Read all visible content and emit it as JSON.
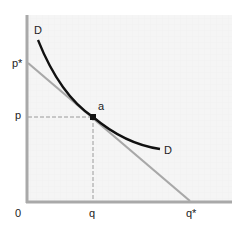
{
  "diagram": {
    "type": "demand-curve-with-tangent",
    "axes": {
      "origin_label": "0",
      "x_ticks": [
        "q",
        "q*"
      ],
      "y_ticks": [
        "p*",
        "p"
      ]
    },
    "curve_labels": {
      "start": "D",
      "end": "D"
    },
    "point_label": "a",
    "colors": {
      "axis": "#a9a9a9",
      "curve": "#111111",
      "tangent": "#a8a8a8",
      "grid_bg": "#f4f4f4",
      "dashed": "#9a9a9a"
    }
  }
}
